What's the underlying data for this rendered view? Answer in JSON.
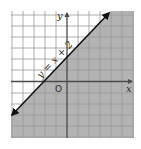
{
  "figure": {
    "type": "inequality-graph",
    "line_label": "y = x + 2",
    "x_axis_label": "x",
    "y_axis_label": "y",
    "origin_label": "O",
    "shaded_region": "below-right of line",
    "colors": {
      "background": "#ffffff",
      "shade": "#b3b3b3",
      "grid_light": "#c8c8c8",
      "grid_dark": "#8a8a8a",
      "axis": "#4a4a4a",
      "line": "#111111"
    }
  }
}
